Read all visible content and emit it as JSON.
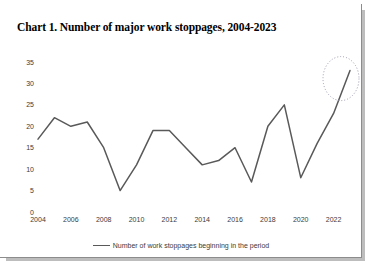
{
  "figure": {
    "title": "Chart 1. Number of major work stoppages, 2004-2023",
    "line_color": "#595959",
    "annotation_color": "#9b9bb0",
    "border_color": "#8c8c8c"
  },
  "legend": {
    "label": "Number of work stoppages beginning in the period",
    "position": "bottom-center"
  },
  "chart_data": {
    "type": "line",
    "title": "Chart 1. Number of major work stoppages, 2004-2023",
    "xlabel": "",
    "ylabel": "",
    "x": [
      2004,
      2005,
      2006,
      2007,
      2008,
      2009,
      2010,
      2011,
      2012,
      2013,
      2014,
      2015,
      2016,
      2017,
      2018,
      2019,
      2020,
      2021,
      2022,
      2023
    ],
    "categories": [
      "2004",
      "2005",
      "2006",
      "2007",
      "2008",
      "2009",
      "2010",
      "2011",
      "2012",
      "2013",
      "2014",
      "2015",
      "2016",
      "2017",
      "2018",
      "2019",
      "2020",
      "2021",
      "2022",
      "2023"
    ],
    "series": [
      {
        "name": "Number of work stoppages beginning in the period",
        "values": [
          17,
          22,
          20,
          21,
          15,
          5,
          11,
          19,
          19,
          15,
          11,
          12,
          15,
          7,
          20,
          25,
          8,
          16,
          23,
          33
        ]
      }
    ],
    "values": [
      17,
      22,
      20,
      21,
      15,
      5,
      11,
      19,
      19,
      15,
      11,
      12,
      15,
      7,
      20,
      25,
      8,
      16,
      23,
      33
    ],
    "ylim": [
      0,
      35
    ],
    "xlim": [
      2004,
      2023
    ],
    "yticks": [
      0,
      5,
      10,
      15,
      20,
      25,
      30,
      35
    ],
    "ytick_labels": [
      "0",
      "5",
      "10",
      "15",
      "20",
      "25",
      "30",
      "35"
    ],
    "xticks": [
      2004,
      2006,
      2008,
      2010,
      2012,
      2014,
      2016,
      2018,
      2020,
      2022
    ],
    "xtick_labels": [
      "2004",
      "2006",
      "2008",
      "2010",
      "2012",
      "2014",
      "2016",
      "2018",
      "2020",
      "2022"
    ],
    "grid": false,
    "legend_entries": [
      "Number of work stoppages beginning in the period"
    ],
    "annotations": [
      {
        "type": "ellipse",
        "shape": "dotted-ellipse",
        "highlights": "2023",
        "value": 33
      }
    ]
  }
}
